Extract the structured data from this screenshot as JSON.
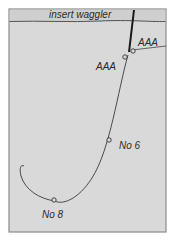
{
  "diagram": {
    "title": "insert waggler",
    "labels": {
      "shot_top": "AAA",
      "shot_lower": "AAA",
      "shot_mid": "No 6",
      "shot_bottom": "No 8"
    },
    "colors": {
      "background": "#d9d9d9",
      "surface_band": "#cfcfcf",
      "frame": "#8a8a8a",
      "line": "#3a3a3a",
      "float": "#1a1a1a",
      "text": "#2a2a2a"
    }
  }
}
